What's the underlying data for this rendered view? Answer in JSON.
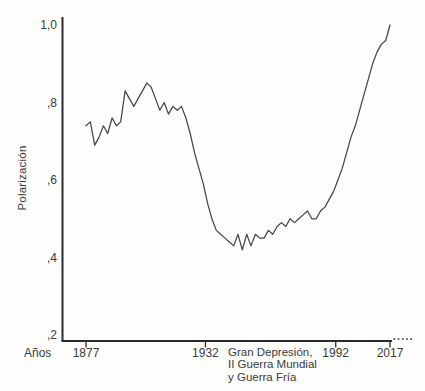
{
  "chart_data": {
    "type": "line",
    "title": "",
    "xlabel": "Años",
    "ylabel": "Polarización",
    "xlim": [
      1877,
      2017
    ],
    "ylim": [
      0.2,
      1.0
    ],
    "grid": false,
    "legend": "none",
    "x_tick_labels": [
      "1877",
      "1932",
      "1992",
      "2017"
    ],
    "x_tick_years": [
      1877,
      1932,
      1992,
      2017
    ],
    "y_tick_labels": [
      "1,0",
      ",8",
      ",6",
      ",4",
      ",2"
    ],
    "y_tick_values": [
      1.0,
      0.8,
      0.6,
      0.4,
      0.2
    ],
    "annotation": "Gran Depresión, II Guerra Mundial y Guerra Fría",
    "annotation_lines": [
      "Gran Depresión,",
      "II Guerra Mundial",
      "y Guerra Fría"
    ],
    "axis_color": "#2b2b2b",
    "line_color": "#454545",
    "text_color": "#3a3a3a",
    "series": [
      {
        "name": "Polarización",
        "x": [
          1877,
          1879,
          1881,
          1883,
          1885,
          1887,
          1889,
          1891,
          1893,
          1895,
          1897,
          1899,
          1901,
          1903,
          1905,
          1907,
          1909,
          1911,
          1913,
          1915,
          1917,
          1919,
          1921,
          1923,
          1925,
          1927,
          1929,
          1931,
          1933,
          1935,
          1937,
          1939,
          1941,
          1943,
          1945,
          1947,
          1949,
          1951,
          1953,
          1955,
          1957,
          1959,
          1961,
          1963,
          1965,
          1967,
          1969,
          1971,
          1973,
          1975,
          1977,
          1979,
          1981,
          1983,
          1985,
          1987,
          1989,
          1991,
          1993,
          1995,
          1997,
          1999,
          2001,
          2003,
          2005,
          2007,
          2009,
          2011,
          2013,
          2015,
          2017
        ],
        "y": [
          0.74,
          0.75,
          0.69,
          0.71,
          0.74,
          0.72,
          0.76,
          0.74,
          0.75,
          0.83,
          0.81,
          0.79,
          0.81,
          0.83,
          0.85,
          0.84,
          0.81,
          0.78,
          0.8,
          0.77,
          0.79,
          0.78,
          0.79,
          0.76,
          0.72,
          0.67,
          0.63,
          0.59,
          0.54,
          0.5,
          0.47,
          0.46,
          0.45,
          0.44,
          0.43,
          0.46,
          0.42,
          0.46,
          0.43,
          0.46,
          0.45,
          0.45,
          0.47,
          0.46,
          0.48,
          0.49,
          0.48,
          0.5,
          0.49,
          0.5,
          0.51,
          0.52,
          0.5,
          0.5,
          0.52,
          0.53,
          0.55,
          0.57,
          0.6,
          0.63,
          0.67,
          0.71,
          0.74,
          0.78,
          0.82,
          0.86,
          0.9,
          0.93,
          0.95,
          0.96,
          1.0
        ]
      }
    ]
  }
}
